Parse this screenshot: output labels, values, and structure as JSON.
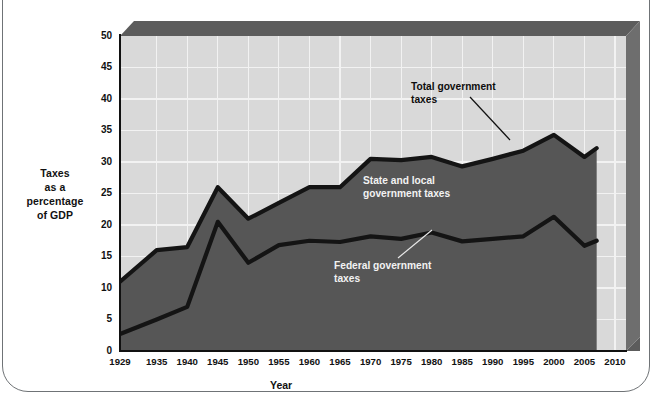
{
  "chart_data": {
    "type": "area",
    "title": "",
    "xlabel": "Year",
    "ylabel": "Taxes as a percentage of GDP",
    "ylabel_lines": [
      "Taxes",
      "as a",
      "percentage",
      "of GDP"
    ],
    "xlim": [
      1929,
      2010
    ],
    "ylim": [
      0,
      50
    ],
    "grid": true,
    "legend_position": "inline-annotations",
    "x": [
      1929,
      1935,
      1940,
      1945,
      1950,
      1955,
      1960,
      1965,
      1970,
      1975,
      1980,
      1985,
      1990,
      1995,
      2000,
      2005,
      2007
    ],
    "xticks": [
      "1929",
      "1935",
      "1940",
      "1945",
      "1950",
      "1955",
      "1960",
      "1965",
      "1970",
      "1975",
      "1980",
      "1985",
      "1990",
      "1995",
      "2000",
      "2005",
      "2010"
    ],
    "xtick_values": [
      1929,
      1935,
      1940,
      1945,
      1950,
      1955,
      1960,
      1965,
      1970,
      1975,
      1980,
      1985,
      1990,
      1995,
      2000,
      2005,
      2010
    ],
    "yticks": [
      "0",
      "5",
      "10",
      "15",
      "20",
      "25",
      "30",
      "35",
      "40",
      "45",
      "50"
    ],
    "ytick_values": [
      0,
      5,
      10,
      15,
      20,
      25,
      30,
      35,
      40,
      45,
      50
    ],
    "series": [
      {
        "name": "Total government taxes",
        "values": [
          11.0,
          16.0,
          16.5,
          26.0,
          21.0,
          23.5,
          26.0,
          26.0,
          30.5,
          30.3,
          30.8,
          29.3,
          30.5,
          31.8,
          34.3,
          30.8,
          32.2
        ]
      },
      {
        "name": "Federal government taxes",
        "values": [
          2.7,
          5.0,
          7.0,
          20.5,
          14.0,
          16.8,
          17.5,
          17.3,
          18.2,
          17.8,
          18.8,
          17.4,
          17.8,
          18.2,
          21.3,
          16.7,
          17.5
        ]
      }
    ],
    "band_label": "State and local government taxes",
    "annotations": [
      {
        "id": "total",
        "text": "Total government\ntaxes",
        "color": "#0d0d0d"
      },
      {
        "id": "state-local",
        "text": "State and local\ngovernment taxes",
        "color": "#f2f2f2"
      },
      {
        "id": "federal",
        "text": "Federal government\ntaxes",
        "color": "#f2f2f2"
      }
    ],
    "colors": {
      "plot_background": "#d9d9d9",
      "area_fill": "#565656",
      "line": "#111111",
      "gridline": "#f4f4f4",
      "bevel_top": "#5c5c5c",
      "bevel_right": "#6b6b6b",
      "axis": "#111111",
      "page_border": "#6f7376"
    }
  }
}
